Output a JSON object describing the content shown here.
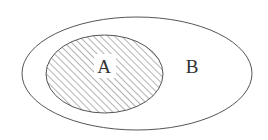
{
  "diagram": {
    "type": "venn-subset",
    "sets": [
      {
        "id": "A",
        "label": "A",
        "shaded": true,
        "subset_of": "B"
      },
      {
        "id": "B",
        "label": "B",
        "shaded": false
      }
    ],
    "colors": {
      "stroke": "#555555",
      "hatch": "#666666",
      "text": "#333333",
      "background": "#ffffff"
    }
  }
}
